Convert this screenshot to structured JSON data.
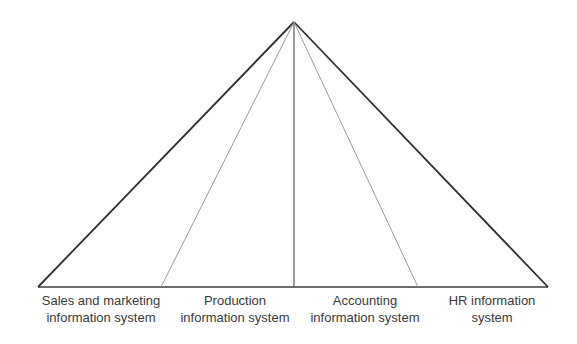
{
  "diagram": {
    "type": "pyramid",
    "apex": {
      "x": 294,
      "y": 22
    },
    "base": {
      "left_x": 38,
      "right_x": 548,
      "y": 287
    },
    "divider_base_x": [
      161,
      294,
      418
    ],
    "colors": {
      "outline": "#2e2e2e",
      "divider_light": "#9a9a9a",
      "divider_center": "#5a5a5a",
      "text": "#3a3a3a"
    },
    "segments": [
      {
        "line1": "Sales and marketing",
        "line2": "information system",
        "center_x": 101
      },
      {
        "line1": "Production",
        "line2": "information system",
        "center_x": 235
      },
      {
        "line1": "Accounting",
        "line2": "information system",
        "center_x": 365
      },
      {
        "line1": "HR information",
        "line2": "system",
        "center_x": 492
      }
    ]
  }
}
